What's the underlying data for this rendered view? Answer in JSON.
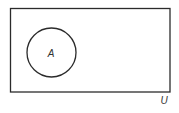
{
  "diagram": {
    "type": "venn",
    "universal_set": {
      "label": "U"
    },
    "sets": [
      {
        "label": "A"
      }
    ],
    "colors": {
      "stroke": "#2b2b2b",
      "background": "#ffffff",
      "text": "#333333"
    }
  }
}
